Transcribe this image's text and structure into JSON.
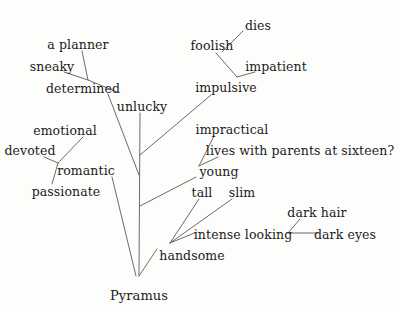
{
  "diagram": {
    "type": "tree",
    "root_label": "Pyramus",
    "background_color": "#fdfdfc",
    "line_color": "#5a5a58",
    "text_color": "#1b1b1b",
    "width": 399,
    "height": 312,
    "nodes": [
      {
        "id": "a-planner",
        "label": "a planner",
        "x": 78,
        "y": 44
      },
      {
        "id": "sneaky",
        "label": "sneaky",
        "x": 52,
        "y": 66
      },
      {
        "id": "determined",
        "label": "determined",
        "x": 83,
        "y": 88
      },
      {
        "id": "unlucky",
        "label": "unlucky",
        "x": 142,
        "y": 106
      },
      {
        "id": "emotional",
        "label": "emotional",
        "x": 65,
        "y": 130
      },
      {
        "id": "devoted",
        "label": "devoted",
        "x": 30,
        "y": 150
      },
      {
        "id": "romantic",
        "label": "romantic",
        "x": 86,
        "y": 170
      },
      {
        "id": "passionate",
        "label": "passionate",
        "x": 66,
        "y": 191
      },
      {
        "id": "dies",
        "label": "dies",
        "x": 258,
        "y": 25
      },
      {
        "id": "foolish",
        "label": "foolish",
        "x": 212,
        "y": 45
      },
      {
        "id": "impatient",
        "label": "impatient",
        "x": 276,
        "y": 66
      },
      {
        "id": "impulsive",
        "label": "impulsive",
        "x": 226,
        "y": 87
      },
      {
        "id": "impractical",
        "label": "impractical",
        "x": 232,
        "y": 129
      },
      {
        "id": "lives",
        "label": "lives with parents at sixteen?",
        "x": 300,
        "y": 150
      },
      {
        "id": "young",
        "label": "young",
        "x": 219,
        "y": 171
      },
      {
        "id": "tall",
        "label": "tall",
        "x": 202,
        "y": 192
      },
      {
        "id": "slim",
        "label": "slim",
        "x": 242,
        "y": 192
      },
      {
        "id": "dark-hair",
        "label": "dark hair",
        "x": 317,
        "y": 212
      },
      {
        "id": "intense",
        "label": "intense looking",
        "x": 243,
        "y": 234
      },
      {
        "id": "dark-eyes",
        "label": "dark eyes",
        "x": 345,
        "y": 234
      },
      {
        "id": "handsome",
        "label": "handsome",
        "x": 192,
        "y": 255
      },
      {
        "id": "pyramus",
        "label": "Pyramus",
        "x": 139,
        "y": 295
      }
    ],
    "edges": [
      {
        "from": "a-planner",
        "to": "determined-junction",
        "points": "82,51 88,80 117,92"
      },
      {
        "from": "sneaky",
        "to": "determined-junction",
        "points": "64,72 88,80"
      },
      {
        "from": "determined",
        "to": "trunk",
        "points": "108,94 139,175"
      },
      {
        "from": "unlucky",
        "to": "trunk-root",
        "points": "140,113 139,276"
      },
      {
        "from": "emotional",
        "to": "romantic-junction",
        "points": "83,137 58,163"
      },
      {
        "from": "devoted",
        "to": "romantic-junction",
        "points": "44,157 58,163"
      },
      {
        "from": "passionate",
        "to": "romantic-junction",
        "points": "52,184 58,163"
      },
      {
        "from": "romantic",
        "to": "root",
        "points": "112,177 136,276"
      },
      {
        "from": "dies",
        "to": "foolish",
        "points": "243,31 222,52"
      },
      {
        "from": "foolish",
        "to": "impulsive-junction",
        "points": "216,53 237,77"
      },
      {
        "from": "impatient",
        "to": "impulsive-junction",
        "points": "255,72 237,77"
      },
      {
        "from": "impulsive",
        "to": "trunk",
        "points": "211,95 140,155"
      },
      {
        "from": "impractical",
        "to": "young-junction",
        "points": "214,136 199,166"
      },
      {
        "from": "lives",
        "to": "young-junction",
        "points": "218,157 199,166"
      },
      {
        "from": "young",
        "to": "trunk",
        "points": "196,177 140,206"
      },
      {
        "from": "tall",
        "to": "handsome-junction",
        "points": "199,199 170,243"
      },
      {
        "from": "slim",
        "to": "handsome-junction",
        "points": "232,199 170,243"
      },
      {
        "from": "intense",
        "to": "handsome-junction",
        "points": "197,232 170,243"
      },
      {
        "from": "dark-hair",
        "to": "intense-junction",
        "points": "300,219 288,233"
      },
      {
        "from": "dark-eyes",
        "to": "intense-junction",
        "points": "288,233 318,233"
      },
      {
        "from": "handsome",
        "to": "root",
        "points": "157,249 139,276"
      }
    ]
  }
}
